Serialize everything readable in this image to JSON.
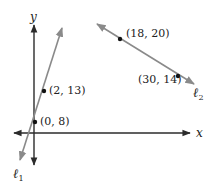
{
  "axes": {
    "x_label": "x",
    "y_label": "y",
    "color": "#2b2b2b"
  },
  "lines": [
    {
      "name": "l1",
      "label": "ℓ",
      "subscript": "1",
      "color": "#8a8a8a",
      "points": [
        {
          "label": "(0, 8)",
          "x": 0,
          "y": 8
        },
        {
          "label": "(2, 13)",
          "x": 2,
          "y": 13
        }
      ]
    },
    {
      "name": "l2",
      "label": "ℓ",
      "subscript": "2",
      "color": "#8a8a8a",
      "points": [
        {
          "label": "(18, 20)",
          "x": 18,
          "y": 20
        },
        {
          "label": "(30, 14)",
          "x": 30,
          "y": 14
        }
      ]
    }
  ]
}
